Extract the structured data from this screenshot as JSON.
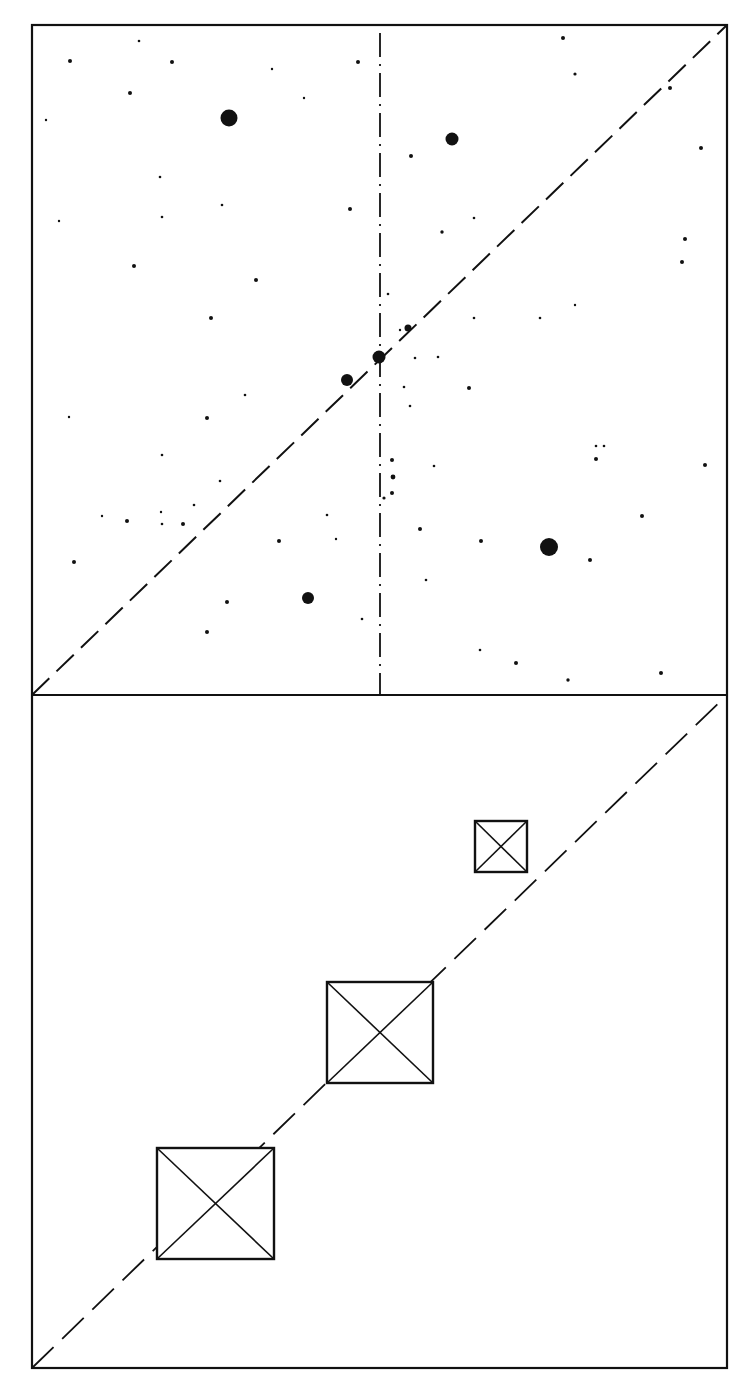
{
  "figure": {
    "background": "#ffffff",
    "ink": "#111111",
    "frame": {
      "left": 32,
      "right": 727,
      "top": 25,
      "divider": 695,
      "bottom": 1368
    },
    "upper_panel": {
      "vertical_axis_x": 380,
      "vertical_axis_style": "dash-dot",
      "diagonal_style": "dashed",
      "large_stars": [
        {
          "x": 229,
          "y": 118,
          "r": 8.5
        },
        {
          "x": 452,
          "y": 139,
          "r": 6.5
        },
        {
          "x": 379,
          "y": 357,
          "r": 6.5
        },
        {
          "x": 347,
          "y": 380,
          "r": 6.0
        },
        {
          "x": 549,
          "y": 547,
          "r": 9.0
        },
        {
          "x": 308,
          "y": 598,
          "r": 6.0
        },
        {
          "x": 408,
          "y": 328,
          "r": 3.5
        }
      ],
      "small_stars": [
        {
          "x": 70,
          "y": 61,
          "r": 2
        },
        {
          "x": 172,
          "y": 62,
          "r": 2
        },
        {
          "x": 139,
          "y": 41,
          "r": 1.3
        },
        {
          "x": 130,
          "y": 93,
          "r": 2
        },
        {
          "x": 46,
          "y": 120,
          "r": 1.2
        },
        {
          "x": 358,
          "y": 62,
          "r": 2
        },
        {
          "x": 272,
          "y": 69,
          "r": 1.2
        },
        {
          "x": 304,
          "y": 98,
          "r": 1.2
        },
        {
          "x": 563,
          "y": 38,
          "r": 2
        },
        {
          "x": 575,
          "y": 74,
          "r": 1.6
        },
        {
          "x": 670,
          "y": 88,
          "r": 2
        },
        {
          "x": 701,
          "y": 148,
          "r": 2
        },
        {
          "x": 411,
          "y": 156,
          "r": 2
        },
        {
          "x": 160,
          "y": 177,
          "r": 1.3
        },
        {
          "x": 222,
          "y": 205,
          "r": 1.3
        },
        {
          "x": 350,
          "y": 209,
          "r": 2
        },
        {
          "x": 442,
          "y": 232,
          "r": 1.7
        },
        {
          "x": 474,
          "y": 218,
          "r": 1.3
        },
        {
          "x": 685,
          "y": 239,
          "r": 2
        },
        {
          "x": 134,
          "y": 266,
          "r": 2
        },
        {
          "x": 59,
          "y": 221,
          "r": 1.2
        },
        {
          "x": 256,
          "y": 280,
          "r": 2
        },
        {
          "x": 162,
          "y": 217,
          "r": 1.3
        },
        {
          "x": 682,
          "y": 262,
          "r": 2
        },
        {
          "x": 211,
          "y": 318,
          "r": 2
        },
        {
          "x": 388,
          "y": 294,
          "r": 1.3
        },
        {
          "x": 474,
          "y": 318,
          "r": 1.3
        },
        {
          "x": 540,
          "y": 318,
          "r": 1.3
        },
        {
          "x": 575,
          "y": 305,
          "r": 1.2
        },
        {
          "x": 69,
          "y": 417,
          "r": 1.2
        },
        {
          "x": 207,
          "y": 418,
          "r": 2
        },
        {
          "x": 162,
          "y": 455,
          "r": 1.3
        },
        {
          "x": 245,
          "y": 395,
          "r": 1.3
        },
        {
          "x": 404,
          "y": 387,
          "r": 1.3
        },
        {
          "x": 415,
          "y": 358,
          "r": 1.3
        },
        {
          "x": 438,
          "y": 357,
          "r": 1.3
        },
        {
          "x": 469,
          "y": 388,
          "r": 2
        },
        {
          "x": 410,
          "y": 406,
          "r": 1.3
        },
        {
          "x": 596,
          "y": 446,
          "r": 1.3
        },
        {
          "x": 604,
          "y": 446,
          "r": 1.3
        },
        {
          "x": 596,
          "y": 459,
          "r": 2
        },
        {
          "x": 705,
          "y": 465,
          "r": 2
        },
        {
          "x": 392,
          "y": 460,
          "r": 2
        },
        {
          "x": 393,
          "y": 477,
          "r": 2.4
        },
        {
          "x": 392,
          "y": 493,
          "r": 2
        },
        {
          "x": 384,
          "y": 498,
          "r": 1.6
        },
        {
          "x": 327,
          "y": 515,
          "r": 1.3
        },
        {
          "x": 220,
          "y": 481,
          "r": 1.3
        },
        {
          "x": 102,
          "y": 516,
          "r": 1.2
        },
        {
          "x": 127,
          "y": 521,
          "r": 2
        },
        {
          "x": 162,
          "y": 524,
          "r": 1.3
        },
        {
          "x": 161,
          "y": 512,
          "r": 1.2
        },
        {
          "x": 183,
          "y": 524,
          "r": 2
        },
        {
          "x": 194,
          "y": 505,
          "r": 1.3
        },
        {
          "x": 279,
          "y": 541,
          "r": 2
        },
        {
          "x": 420,
          "y": 529,
          "r": 2
        },
        {
          "x": 481,
          "y": 541,
          "r": 2
        },
        {
          "x": 642,
          "y": 516,
          "r": 2
        },
        {
          "x": 590,
          "y": 560,
          "r": 2
        },
        {
          "x": 426,
          "y": 580,
          "r": 1.3
        },
        {
          "x": 74,
          "y": 562,
          "r": 2
        },
        {
          "x": 227,
          "y": 602,
          "r": 2
        },
        {
          "x": 207,
          "y": 632,
          "r": 2
        },
        {
          "x": 362,
          "y": 619,
          "r": 1.3
        },
        {
          "x": 480,
          "y": 650,
          "r": 1.3
        },
        {
          "x": 516,
          "y": 663,
          "r": 2
        },
        {
          "x": 568,
          "y": 680,
          "r": 1.7
        },
        {
          "x": 661,
          "y": 673,
          "r": 2
        },
        {
          "x": 434,
          "y": 466,
          "r": 1.3
        },
        {
          "x": 400,
          "y": 330,
          "r": 1.2
        },
        {
          "x": 336,
          "y": 539,
          "r": 1.2
        }
      ]
    },
    "lower_panel": {
      "diagonal_style": "dashed",
      "crossed_boxes": [
        {
          "x": 475,
          "y": 821,
          "w": 52,
          "h": 51
        },
        {
          "x": 327,
          "y": 982,
          "w": 106,
          "h": 101
        },
        {
          "x": 157,
          "y": 1148,
          "w": 117,
          "h": 111
        }
      ]
    }
  }
}
